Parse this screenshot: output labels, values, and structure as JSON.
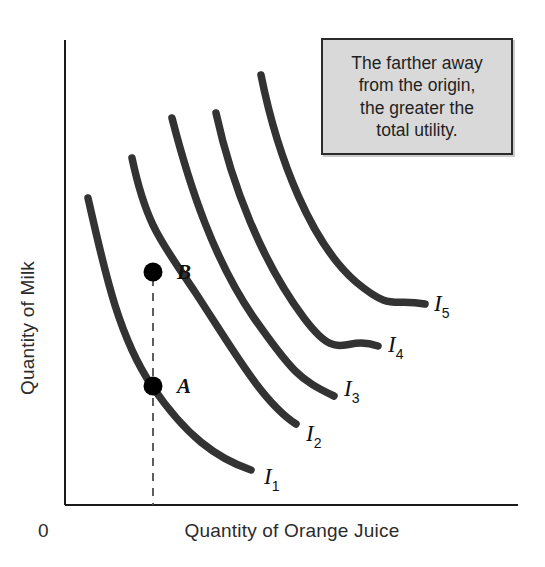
{
  "figure": {
    "type": "indifference-curve-map",
    "background_color": "#ffffff",
    "curve_color": "#333333",
    "axis_color": "#1a1a1a"
  },
  "axes": {
    "x_label": "Quantity of Orange Juice",
    "y_label": "Quantity of Milk",
    "origin_label": "0"
  },
  "callout": {
    "text": "The farther away\nfrom the origin,\nthe greater the\ntotal utility.",
    "fill_color": "#d9d9d9",
    "border_color": "#2b2b2b"
  },
  "points": [
    {
      "label": "B",
      "x": 153,
      "y": 272
    },
    {
      "label": "A",
      "x": 153,
      "y": 386
    }
  ],
  "curve_labels": [
    {
      "main": "I",
      "sub": "1",
      "x": 264,
      "y": 484
    },
    {
      "main": "I",
      "sub": "2",
      "x": 306,
      "y": 441
    },
    {
      "main": "I",
      "sub": "3",
      "x": 344,
      "y": 396
    },
    {
      "main": "I",
      "sub": "4",
      "x": 388,
      "y": 352
    },
    {
      "main": "I",
      "sub": "5",
      "x": 434,
      "y": 311
    }
  ],
  "chart_data": {
    "type": "line",
    "title": "",
    "xlabel": "Quantity of Orange Juice",
    "ylabel": "Quantity of Milk",
    "grid": false,
    "legend_position": "inline-right-of-curve-ends",
    "annotations": [
      {
        "kind": "text-box",
        "text": "The farther away from the origin, the greater the total utility."
      },
      {
        "kind": "point",
        "label": "B",
        "note": "on curve I2, higher milk at same orange juice"
      },
      {
        "kind": "point",
        "label": "A",
        "note": "on curve I1, lower milk at same orange juice"
      },
      {
        "kind": "dashed-vertical",
        "note": "constant quantity of orange juice through A and B down to x-axis"
      }
    ],
    "series": [
      {
        "name": "I1",
        "path": "M88,198 C104,268 118,336 152,386 C186,436 216,458 251,470",
        "utility_rank": 1
      },
      {
        "name": "I2",
        "path": "M132,158 C146,224 160,240 195,292 C232,348 262,402 296,424",
        "utility_rank": 2
      },
      {
        "name": "I3",
        "path": "M172,118 C190,188 214,260 254,318 C292,372 300,380 334,396",
        "utility_rank": 3
      },
      {
        "name": "I4",
        "path": "M216,113 C232,186 262,262 304,318 C340,366 342,334 378,346",
        "utility_rank": 4
      },
      {
        "name": "I5",
        "path": "M261,75 C278,160 312,244 356,282 C392,312 392,298 425,304",
        "utility_rank": 5
      }
    ],
    "axis_ranges": {
      "x": [
        65,
        518
      ],
      "y": [
        40,
        505
      ]
    }
  }
}
